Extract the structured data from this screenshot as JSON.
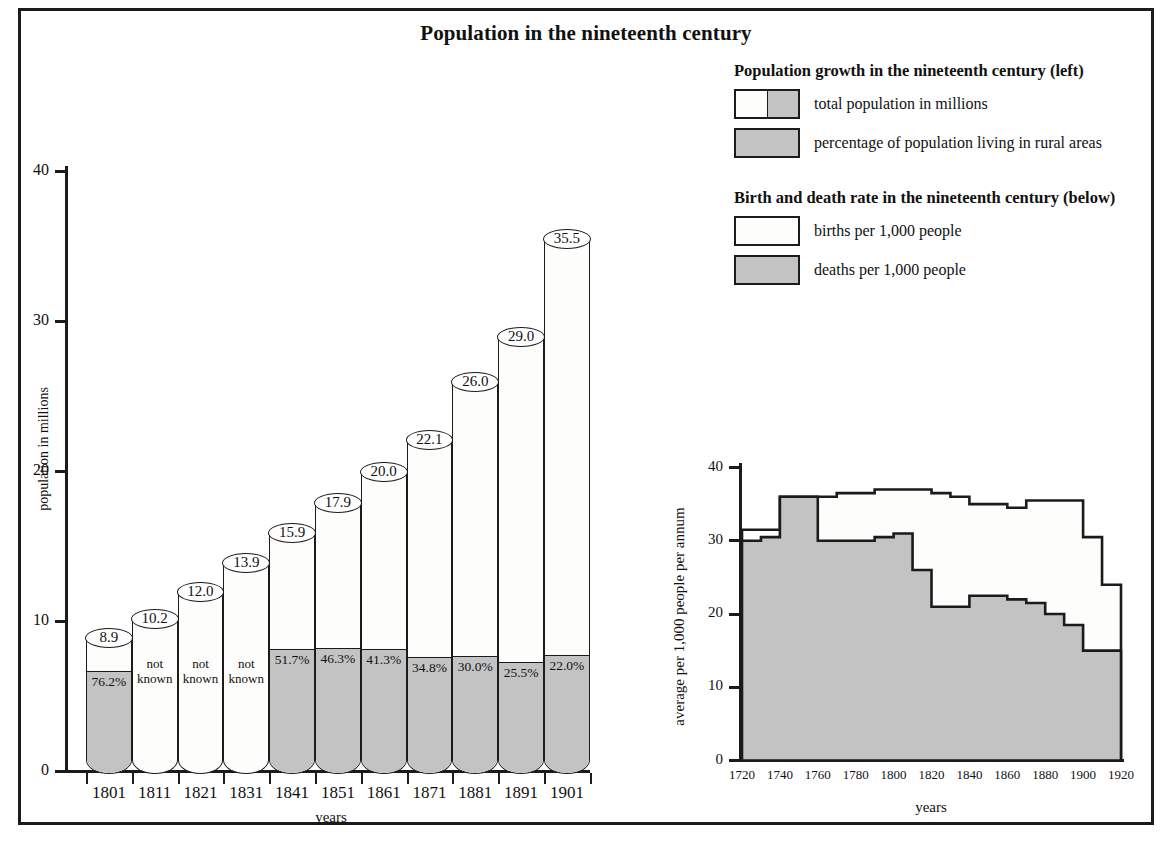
{
  "title": "Population in the nineteenth century",
  "legend": {
    "group1": {
      "heading": "Population growth in the nineteenth century (left)",
      "items": [
        {
          "label": "total population in millions",
          "swatch": "split-white-gray"
        },
        {
          "label": "percentage of population living in rural areas",
          "swatch": "gray"
        }
      ]
    },
    "group2": {
      "heading": "Birth and death rate in the nineteenth century (below)",
      "items": [
        {
          "label": "births per 1,000 people",
          "swatch": "white"
        },
        {
          "label": "deaths per 1,000 people",
          "swatch": "gray"
        }
      ]
    }
  },
  "chart_data": [
    {
      "type": "bar",
      "title": "Population growth in the nineteenth century",
      "xlabel": "years",
      "ylabel": "population in millions",
      "ylim": [
        0,
        40
      ],
      "yticks": [
        0,
        10,
        20,
        30,
        40
      ],
      "grid": false,
      "categories": [
        "1801",
        "1811",
        "1821",
        "1831",
        "1841",
        "1851",
        "1861",
        "1871",
        "1881",
        "1891",
        "1901"
      ],
      "series": [
        {
          "name": "total population in millions",
          "values": [
            8.9,
            10.2,
            12.0,
            13.9,
            15.9,
            17.9,
            20.0,
            22.1,
            26.0,
            29.0,
            35.5
          ],
          "labels": [
            "8.9",
            "10.2",
            "12.0",
            "13.9",
            "15.9",
            "17.9",
            "20.0",
            "22.1",
            "26.0",
            "29.0",
            "35.5"
          ]
        },
        {
          "name": "percentage of population living in rural areas",
          "values": [
            76.2,
            null,
            null,
            null,
            51.7,
            46.3,
            41.3,
            34.8,
            30.0,
            25.5,
            22.0
          ],
          "labels": [
            "76.2%",
            "not known",
            "not known",
            "not known",
            "51.7%",
            "46.3%",
            "41.3%",
            "34.8%",
            "30.0%",
            "25.5%",
            "22.0%"
          ]
        }
      ]
    },
    {
      "type": "area",
      "title": "Birth and death rate in the nineteenth century",
      "xlabel": "years",
      "ylabel": "average per 1,000 people per annum",
      "ylim": [
        0,
        40
      ],
      "yticks": [
        0,
        10,
        20,
        30,
        40
      ],
      "xlim": [
        1720,
        1920
      ],
      "xticks": [
        "1720",
        "1740",
        "1760",
        "1780",
        "1800",
        "1820",
        "1840",
        "1860",
        "1880",
        "1900",
        "1920"
      ],
      "grid": false,
      "decade_starts": [
        1720,
        1730,
        1740,
        1750,
        1760,
        1770,
        1780,
        1790,
        1800,
        1810,
        1820,
        1830,
        1840,
        1850,
        1860,
        1870,
        1880,
        1890,
        1900,
        1910
      ],
      "series": [
        {
          "name": "births per 1,000 people",
          "values": [
            31.5,
            31.5,
            36.0,
            36.0,
            36.0,
            36.5,
            36.5,
            37.0,
            37.0,
            37.0,
            36.5,
            36.0,
            35.0,
            35.0,
            34.5,
            35.5,
            35.5,
            35.5,
            30.5,
            24.0
          ]
        },
        {
          "name": "deaths per 1,000 people",
          "values": [
            30.0,
            30.5,
            36.0,
            36.0,
            30.0,
            30.0,
            30.0,
            30.5,
            31.0,
            26.0,
            21.0,
            21.0,
            22.5,
            22.5,
            22.0,
            21.5,
            20.0,
            18.5,
            15.0,
            15.0
          ]
        }
      ]
    }
  ]
}
